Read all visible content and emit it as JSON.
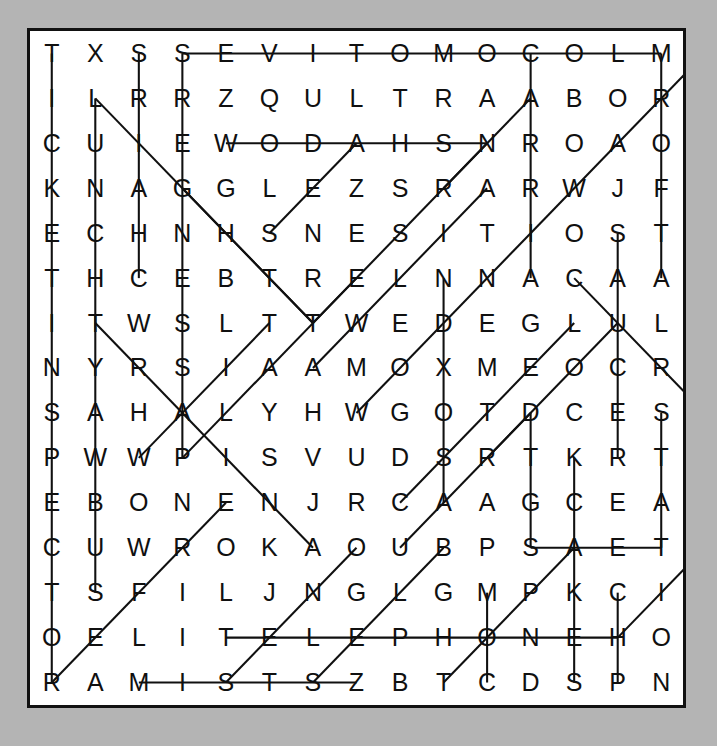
{
  "puzzle": {
    "type": "word-search",
    "rows": 15,
    "cols": 15,
    "background_color": "#b4b4b4",
    "paper_color": "#ffffff",
    "ink_color": "#101010",
    "grid": [
      [
        "T",
        "X",
        "S",
        "S",
        "E",
        "V",
        "I",
        "T",
        "O",
        "M",
        "O",
        "C",
        "O",
        "L",
        "M"
      ],
      [
        "I",
        "L",
        "R",
        "R",
        "Z",
        "Q",
        "U",
        "L",
        "T",
        "R",
        "A",
        "A",
        "B",
        "O",
        "R"
      ],
      [
        "C",
        "U",
        "I",
        "E",
        "W",
        "O",
        "D",
        "A",
        "H",
        "S",
        "N",
        "R",
        "O",
        "A",
        "O"
      ],
      [
        "K",
        "N",
        "A",
        "G",
        "G",
        "L",
        "E",
        "Z",
        "S",
        "R",
        "A",
        "R",
        "W",
        "J",
        "F"
      ],
      [
        "E",
        "C",
        "H",
        "N",
        "H",
        "S",
        "N",
        "E",
        "S",
        "I",
        "T",
        "I",
        "O",
        "S",
        "T"
      ],
      [
        "T",
        "H",
        "C",
        "E",
        "B",
        "T",
        "R",
        "E",
        "L",
        "N",
        "N",
        "A",
        "C",
        "A",
        "A"
      ],
      [
        "I",
        "T",
        "W",
        "S",
        "L",
        "T",
        "T",
        "W",
        "E",
        "D",
        "E",
        "G",
        "L",
        "U",
        "L"
      ],
      [
        "N",
        "Y",
        "R",
        "S",
        "I",
        "A",
        "A",
        "M",
        "O",
        "X",
        "M",
        "E",
        "O",
        "C",
        "R"
      ],
      [
        "S",
        "A",
        "H",
        "A",
        "L",
        "Y",
        "H",
        "W",
        "G",
        "O",
        "T",
        "D",
        "C",
        "E",
        "S"
      ],
      [
        "P",
        "W",
        "W",
        "P",
        "I",
        "S",
        "V",
        "U",
        "D",
        "S",
        "R",
        "T",
        "K",
        "R",
        "T"
      ],
      [
        "E",
        "B",
        "O",
        "N",
        "E",
        "N",
        "J",
        "R",
        "C",
        "A",
        "A",
        "G",
        "C",
        "E",
        "A"
      ],
      [
        "C",
        "U",
        "W",
        "R",
        "O",
        "K",
        "A",
        "O",
        "U",
        "B",
        "P",
        "S",
        "A",
        "E",
        "T"
      ],
      [
        "T",
        "S",
        "F",
        "I",
        "L",
        "J",
        "N",
        "G",
        "L",
        "G",
        "M",
        "P",
        "K",
        "C",
        "I"
      ],
      [
        "O",
        "E",
        "L",
        "I",
        "T",
        "E",
        "L",
        "E",
        "P",
        "H",
        "O",
        "N",
        "E",
        "H",
        "O"
      ],
      [
        "R",
        "A",
        "M",
        "I",
        "S",
        "T",
        "S",
        "Z",
        "B",
        "T",
        "C",
        "D",
        "S",
        "P",
        "N"
      ]
    ],
    "strikes": [
      {
        "name": "strike-row1-automotive",
        "r1": 0,
        "c1": 3,
        "r2": 0,
        "c2": 14
      },
      {
        "name": "strike-row3-shadow",
        "r1": 2,
        "c1": 4,
        "r2": 2,
        "c2": 10
      },
      {
        "name": "strike-row14-telephone",
        "r1": 13,
        "c1": 4,
        "r2": 13,
        "c2": 13
      },
      {
        "name": "strike-row12-skate",
        "r1": 11,
        "c1": 11,
        "r2": 11,
        "c2": 14
      },
      {
        "name": "strike-row15-mist",
        "r1": 14,
        "c1": 2,
        "r2": 14,
        "c2": 7
      },
      {
        "name": "strike-col1-ticketshop",
        "r1": 0,
        "c1": 0,
        "r2": 14,
        "c2": 0
      },
      {
        "name": "strike-col2-vertical",
        "r1": 1,
        "c1": 1,
        "r2": 12,
        "c2": 1
      },
      {
        "name": "strike-col3-vertical",
        "r1": 0,
        "c1": 2,
        "r2": 5,
        "c2": 2
      },
      {
        "name": "strike-col4-vertical",
        "r1": 0,
        "c1": 3,
        "r2": 9,
        "c2": 3
      },
      {
        "name": "strike-col12-vertical",
        "r1": 0,
        "c1": 11,
        "r2": 5,
        "c2": 11
      },
      {
        "name": "strike-col10-vertical",
        "r1": 5,
        "c1": 9,
        "r2": 10,
        "c2": 9
      },
      {
        "name": "strike-col12b-vertical",
        "r1": 8,
        "c1": 11,
        "r2": 11,
        "c2": 11
      },
      {
        "name": "strike-col14-vertical",
        "r1": 4,
        "c1": 13,
        "r2": 9,
        "c2": 13
      },
      {
        "name": "strike-col15-vertical",
        "r1": 0,
        "c1": 14,
        "r2": 5,
        "c2": 14
      },
      {
        "name": "strike-col15b-vertical",
        "r1": 8,
        "c1": 14,
        "r2": 11,
        "c2": 14
      },
      {
        "name": "strike-col13-vertical",
        "r1": 9,
        "c1": 12,
        "r2": 14,
        "c2": 12
      },
      {
        "name": "strike-col11-vertical",
        "r1": 12,
        "c1": 10,
        "r2": 14,
        "c2": 10
      },
      {
        "name": "strike-col14b-vertical",
        "r1": 12,
        "c1": 13,
        "r2": 14,
        "c2": 13
      },
      {
        "name": "strike-diag-down-a",
        "r1": 1,
        "c1": 1,
        "r2": 6,
        "c2": 6
      },
      {
        "name": "strike-diag-down-b",
        "r1": 3,
        "c1": 3,
        "r2": 6,
        "c2": 6
      },
      {
        "name": "strike-diag-down-c",
        "r1": 6,
        "c1": 1,
        "r2": 11,
        "c2": 6
      },
      {
        "name": "strike-diag-down-d",
        "r1": 5,
        "c1": 12,
        "r2": 8,
        "c2": 15
      },
      {
        "name": "strike-diag-up-a",
        "r1": 4,
        "c1": 5,
        "r2": 2,
        "c2": 7
      },
      {
        "name": "strike-diag-up-b",
        "r1": 3,
        "c1": 9,
        "r2": 1,
        "c2": 11
      },
      {
        "name": "strike-diag-up-c",
        "r1": 4,
        "c1": 11,
        "r2": 0,
        "c2": 15
      },
      {
        "name": "strike-diag-up-d",
        "r1": 6,
        "c1": 6,
        "r2": 2,
        "c2": 10
      },
      {
        "name": "strike-diag-up-e",
        "r1": 7,
        "c1": 6,
        "r2": 3,
        "c2": 10
      },
      {
        "name": "strike-diag-up-f",
        "r1": 8,
        "c1": 7,
        "r2": 4,
        "c2": 11
      },
      {
        "name": "strike-diag-up-g",
        "r1": 9,
        "c1": 3,
        "r2": 5,
        "c2": 7
      },
      {
        "name": "strike-diag-up-h",
        "r1": 9,
        "c1": 2,
        "r2": 6,
        "c2": 5
      },
      {
        "name": "strike-diag-up-i",
        "r1": 9,
        "c1": 10,
        "r2": 6,
        "c2": 13
      },
      {
        "name": "strike-diag-up-j",
        "r1": 10,
        "c1": 8,
        "r2": 6,
        "c2": 12
      },
      {
        "name": "strike-diag-up-k",
        "r1": 11,
        "c1": 8,
        "r2": 8,
        "c2": 11
      },
      {
        "name": "strike-diag-up-l",
        "r1": 14,
        "c1": 0,
        "r2": 10,
        "c2": 4
      },
      {
        "name": "strike-diag-up-m",
        "r1": 14,
        "c1": 4,
        "r2": 11,
        "c2": 7
      },
      {
        "name": "strike-diag-up-n",
        "r1": 14,
        "c1": 6,
        "r2": 11,
        "c2": 9
      },
      {
        "name": "strike-diag-up-o",
        "r1": 14,
        "c1": 9,
        "r2": 11,
        "c2": 12
      },
      {
        "name": "strike-diag-up-p",
        "r1": 13,
        "c1": 13,
        "r2": 11,
        "c2": 15
      }
    ]
  }
}
